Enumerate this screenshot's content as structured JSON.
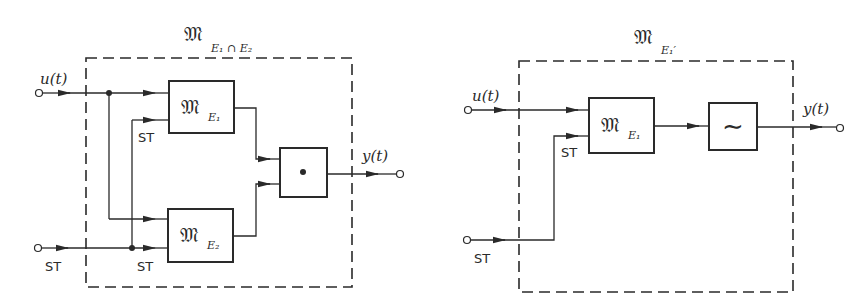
{
  "left_diagram": {
    "title_main": "𝔐",
    "title_sub": "E₁ ∩ E₂",
    "input_u_label": "u(t)",
    "input_st_label": "ST",
    "inner_st_label_top": "ST",
    "inner_st_label_bottom": "ST",
    "block_e1": {
      "main": "𝔐",
      "sub": "E₁"
    },
    "block_e2": {
      "main": "𝔐",
      "sub": "E₂"
    },
    "combiner_symbol": "•",
    "output_label": "y(t)"
  },
  "right_diagram": {
    "title_main": "𝔐",
    "title_sub": "E₁′",
    "input_u_label": "u(t)",
    "input_st_label": "ST",
    "inner_st_label": "ST",
    "block_e1": {
      "main": "𝔐",
      "sub": "E₁"
    },
    "filter_symbol": "∼",
    "output_label": "y(t)"
  },
  "colors": {
    "ink": "#2a2a2a",
    "background": "#ffffff"
  }
}
